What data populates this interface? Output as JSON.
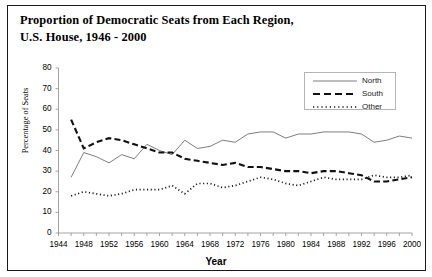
{
  "title": {
    "line1": "Proportion of Democratic Seats from Each Region,",
    "line2": "U.S. House, 1946 - 2000"
  },
  "axes": {
    "xlabel": "Year",
    "ylabel": "Percentage of Seats",
    "xticks": [
      "1944",
      "1948",
      "1952",
      "1956",
      "1960",
      "1964",
      "1968",
      "1972",
      "1976",
      "1980",
      "1984",
      "1988",
      "1992",
      "1996",
      "2000"
    ],
    "yticks": [
      "0",
      "10",
      "20",
      "30",
      "40",
      "50",
      "60",
      "70",
      "80"
    ]
  },
  "legend": {
    "items": [
      {
        "label": "North",
        "style": "solid",
        "color": "#6e6e6e"
      },
      {
        "label": "South",
        "style": "dashed",
        "color": "#111111"
      },
      {
        "label": "Other",
        "style": "dotted",
        "color": "#111111"
      }
    ]
  },
  "chart_data": {
    "type": "line",
    "title": "Proportion of Democratic Seats from Each Region, U.S. House, 1946 - 2000",
    "xlabel": "Year",
    "ylabel": "Percentage of Seats",
    "xlim": [
      1944,
      2000
    ],
    "ylim": [
      0,
      80
    ],
    "grid": false,
    "legend_position": "top-right",
    "x": [
      1946,
      1948,
      1950,
      1952,
      1954,
      1956,
      1958,
      1960,
      1962,
      1964,
      1966,
      1968,
      1970,
      1972,
      1974,
      1976,
      1978,
      1980,
      1982,
      1984,
      1986,
      1988,
      1990,
      1992,
      1994,
      1996,
      1998,
      2000
    ],
    "series": [
      {
        "name": "North",
        "style": "solid",
        "color": "#6e6e6e",
        "values": [
          27,
          39,
          37,
          34,
          38,
          36,
          43,
          40,
          38,
          45,
          41,
          42,
          45,
          44,
          48,
          49,
          49,
          46,
          48,
          48,
          49,
          49,
          49,
          48,
          44,
          45,
          47,
          46
        ]
      },
      {
        "name": "South",
        "style": "dashed",
        "color": "#111111",
        "values": [
          55,
          41,
          44,
          46,
          45,
          43,
          41,
          39,
          39,
          36,
          35,
          34,
          33,
          34,
          32,
          32,
          31,
          30,
          30,
          29,
          30,
          30,
          29,
          28,
          25,
          25,
          26,
          27
        ]
      },
      {
        "name": "Other",
        "style": "dotted",
        "color": "#111111",
        "values": [
          18,
          20,
          19,
          18,
          19,
          21,
          21,
          21,
          23,
          19,
          24,
          24,
          22,
          23,
          25,
          27,
          26,
          24,
          23,
          25,
          27,
          26,
          26,
          26,
          28,
          27,
          27,
          28
        ]
      }
    ]
  }
}
